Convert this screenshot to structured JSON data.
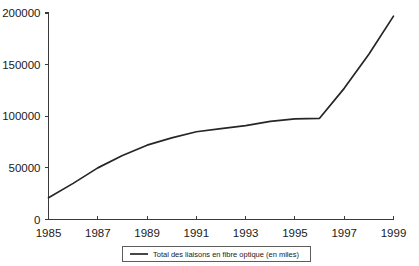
{
  "chart_data": {
    "type": "line",
    "title": "",
    "subtitle": "",
    "xlabel": "",
    "ylabel": "",
    "x": [
      1985,
      1986,
      1987,
      1988,
      1989,
      1990,
      1991,
      1992,
      1993,
      1994,
      1995,
      1996,
      1997,
      1998,
      1999
    ],
    "series": [
      {
        "name": "Total des liaisons en fibre optique (en miles)",
        "values": [
          21000,
          35000,
          50000,
          62000,
          72000,
          79000,
          85000,
          88000,
          91000,
          95000,
          97500,
          98000,
          127000,
          160000,
          197000
        ],
        "color": "#262626"
      }
    ],
    "xlim": [
      1985,
      1999
    ],
    "ylim": [
      0,
      200000
    ],
    "xticks": [
      1985,
      1987,
      1989,
      1991,
      1993,
      1995,
      1997,
      1999
    ],
    "xtick_labels": [
      "1985",
      "1987",
      "1989",
      "1991",
      "1993",
      "1995",
      "1997",
      "1999"
    ],
    "yticks": [
      0,
      50000,
      100000,
      150000,
      200000
    ],
    "ytick_labels": [
      "0",
      "50000",
      "100000",
      "150000",
      "200000"
    ],
    "grid": false,
    "legend_position": "bottom-center",
    "legend_entries": [
      "Total des liaisons en fibre optique (en miles)"
    ],
    "background_color": "#ffffff",
    "axis_color": "#3a3a3a"
  }
}
